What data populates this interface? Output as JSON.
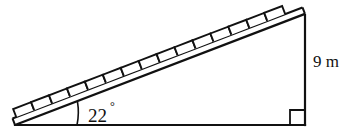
{
  "figure": {
    "name": "staircase-ramp-right-triangle",
    "background_color": "#ffffff",
    "line_color": "#111111",
    "labels": {
      "angle_value": "22",
      "angle_degree_symbol": "°",
      "height_value": "9 m"
    },
    "geometry": {
      "left_vertex": [
        15,
        125
      ],
      "right_vertex": [
        305,
        125
      ],
      "apex": [
        305,
        14
      ],
      "base_length_px": 290,
      "height_px": 111,
      "angle_degrees": 22,
      "right_angle_marker_size_px": 15,
      "angle_arc_radius_px": 62,
      "step_count": 15,
      "beam_thickness_px": 7
    },
    "elements": {
      "base_name": "triangle-base-line",
      "vertical_name": "triangle-vertical-side",
      "hypotenuse_name": "staircase-ramp-beam",
      "steps_name": "staircase-steps",
      "angle_arc_name": "angle-arc",
      "right_angle_name": "right-angle-marker",
      "angle_label_name": "angle-label-22-degrees",
      "height_label_name": "height-label-9-m"
    }
  }
}
